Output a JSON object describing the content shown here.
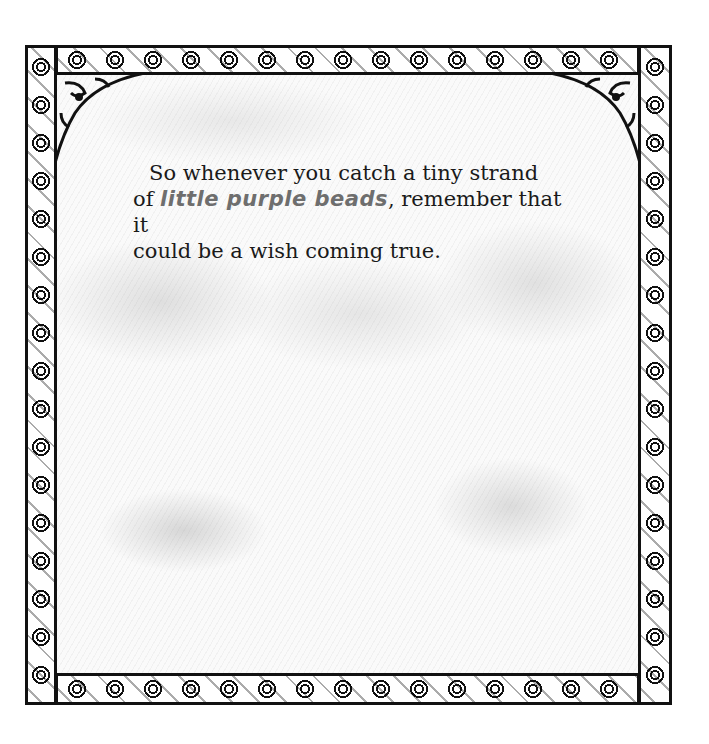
{
  "page": {
    "text": {
      "line1": "So whenever you catch a tiny strand",
      "line2_prefix": "of ",
      "line2_highlight": "little purple beads",
      "line2_suffix": ", remember that it",
      "line3": "could be a wish coming true."
    },
    "frame": {
      "style": "ornate wrought-iron scroll border",
      "color": "#111111"
    },
    "background": {
      "style": "grey pencil-shaded texture",
      "color": "#fafafa"
    }
  }
}
